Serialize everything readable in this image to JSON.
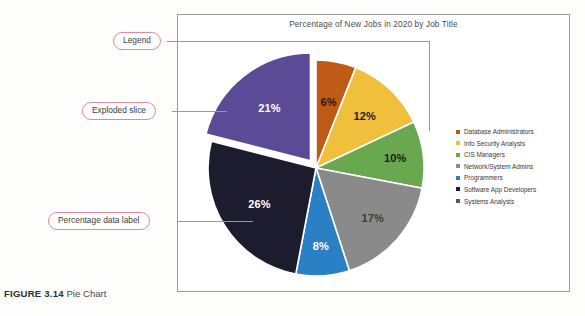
{
  "figure": {
    "caption_label": "FIGURE 3.14",
    "caption_text": "Pie Chart"
  },
  "callouts": [
    {
      "id": "legend",
      "label": "Legend"
    },
    {
      "id": "exploded",
      "label": "Exploded slice"
    },
    {
      "id": "datalabel",
      "label": "Percentage data label"
    }
  ],
  "chart_data": {
    "type": "pie",
    "title": "Percentage of New Jobs in 2020 by Job Title",
    "xlabel": "",
    "ylabel": "",
    "legend_position": "right",
    "grid": false,
    "units": "percent",
    "exploded_slice": "Systems Analysts",
    "categories": [
      "Database Administrators",
      "Info Security Analysts",
      "CIS Managers",
      "Network/System Admins",
      "Programmers",
      "Software App Developers",
      "Systems Analysts"
    ],
    "values": [
      6,
      12,
      10,
      17,
      8,
      26,
      21
    ],
    "data_labels": [
      "6%",
      "12%",
      "10%",
      "17%",
      "8%",
      "26%",
      "21%"
    ],
    "colors": [
      "#c05a17",
      "#f0c03c",
      "#6aa84f",
      "#8a8a8a",
      "#2980c4",
      "#1c1c2e",
      "#5b4a96"
    ],
    "label_text_colors": [
      "#1c1c1c",
      "#1c1c1c",
      "#1c1c1c",
      "#3a3a3a",
      "#ffffff",
      "#ffffff",
      "#ffffff"
    ]
  }
}
